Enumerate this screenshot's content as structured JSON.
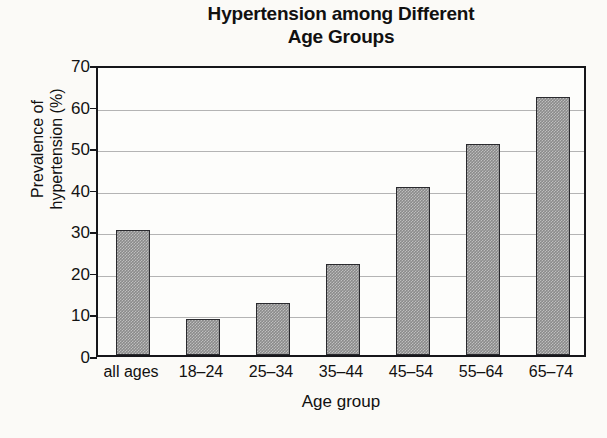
{
  "chart_data": {
    "type": "bar",
    "title": "Hypertension among Different Age Groups",
    "title_lines": [
      "Hypertension among Different",
      "Age Groups"
    ],
    "xlabel": "Age group",
    "ylabel": "Prevalence of hypertension (%)",
    "ylabel_lines": [
      "Prevalence of",
      "hypertension (%)"
    ],
    "categories": [
      "all ages",
      "18–24",
      "25–34",
      "35–44",
      "45–54",
      "55–64",
      "65–74"
    ],
    "values": [
      30,
      8.7,
      12.5,
      22,
      40.5,
      50.8,
      62
    ],
    "ylim": [
      0,
      70
    ],
    "ytick_values": [
      0,
      10,
      20,
      30,
      40,
      50,
      60,
      70
    ],
    "ytick_labels": [
      "0",
      "10",
      "20",
      "30",
      "40",
      "50",
      "60",
      "70"
    ],
    "grid": "horizontal",
    "legend": "none",
    "bar_color": "#8b8b8b",
    "bar_edge_color": "#2a2a2e",
    "gridline_color": "#b4b4b4",
    "axis_color": "#16161a",
    "background_color": "#fbfaf7"
  }
}
